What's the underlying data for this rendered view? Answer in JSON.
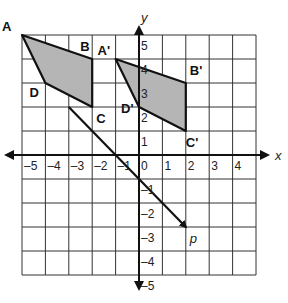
{
  "diagram": {
    "type": "coordinate-grid-translation",
    "grid": {
      "xmin": -5,
      "xmax": 5,
      "ymin": -5,
      "ymax": 5
    },
    "axes": {
      "x_label": "x",
      "y_label": "y"
    },
    "x_ticks": [
      "-5",
      "-4",
      "-3",
      "-2",
      "-1",
      "0",
      "1",
      "2",
      "3",
      "4"
    ],
    "y_ticks": [
      "5",
      "4",
      "3",
      "2",
      "1",
      "-1",
      "-2",
      "-3",
      "-4",
      "-5"
    ],
    "shape_original": {
      "vertices": [
        {
          "label": "A",
          "x": -5,
          "y": 5
        },
        {
          "label": "B",
          "x": -2,
          "y": 4
        },
        {
          "label": "C",
          "x": -2,
          "y": 2
        },
        {
          "label": "D",
          "x": -4,
          "y": 3
        }
      ]
    },
    "shape_image": {
      "vertices": [
        {
          "label": "A'",
          "x": -1,
          "y": 4
        },
        {
          "label": "B'",
          "x": 2,
          "y": 3
        },
        {
          "label": "C'",
          "x": 2,
          "y": 1
        },
        {
          "label": "D'",
          "x": 0,
          "y": 2
        }
      ]
    },
    "vector": {
      "label": "p",
      "from": {
        "x": -3,
        "y": 2
      },
      "to": {
        "x": 2,
        "y": -3
      }
    },
    "colors": {
      "fill": "#b5b5b5",
      "stroke": "#111111",
      "grid": "#333333"
    }
  }
}
